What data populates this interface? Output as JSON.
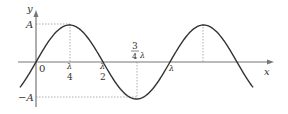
{
  "diagram": {
    "axes": {
      "x_label": "x",
      "y_label": "y",
      "origin_label": "0"
    },
    "amplitude": {
      "positive_label": "A",
      "negative_label": "−A"
    },
    "x_ticks": [
      {
        "num": "λ",
        "den": "4"
      },
      {
        "num": "λ",
        "den": "2"
      },
      {
        "coef_num": "3",
        "coef_den": "4",
        "sym": "λ"
      },
      {
        "sym": "λ"
      }
    ],
    "colors": {
      "curve": "#333333",
      "axis": "#777777",
      "guide": "#999999"
    }
  },
  "chart_data": {
    "type": "line",
    "title": "",
    "xlabel": "x",
    "ylabel": "y",
    "function": "y = A sin(2πx/λ)",
    "x_tick_labels": [
      "0",
      "λ/4",
      "λ/2",
      "3λ/4",
      "λ"
    ],
    "y_tick_labels": [
      "A",
      "−A"
    ],
    "x_range_in_wavelengths": [
      -0.12,
      1.62
    ],
    "points": [
      {
        "x": 0,
        "y": 0
      },
      {
        "x": 0.25,
        "y": 1
      },
      {
        "x": 0.5,
        "y": 0
      },
      {
        "x": 0.75,
        "y": -1
      },
      {
        "x": 1.0,
        "y": 0
      },
      {
        "x": 1.25,
        "y": 1
      },
      {
        "x": 1.5,
        "y": 0
      }
    ],
    "grid": false
  }
}
